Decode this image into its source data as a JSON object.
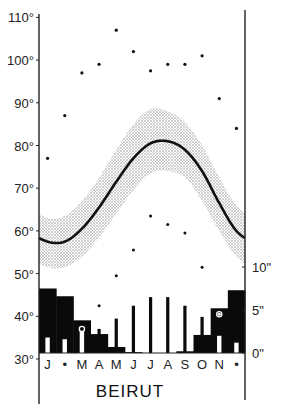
{
  "chart_data": {
    "type": "climate",
    "title": "BEIRUT",
    "months": [
      "J",
      "F",
      "M",
      "A",
      "M",
      "J",
      "J",
      "A",
      "S",
      "O",
      "N",
      "D"
    ],
    "month_label_display": [
      "J",
      "•",
      "M",
      "A",
      "M",
      "J",
      "J",
      "A",
      "S",
      "O",
      "N",
      "•"
    ],
    "temperature_axis": {
      "unit": "°F",
      "ticks": [
        30,
        40,
        50,
        60,
        70,
        80,
        90,
        100,
        110
      ],
      "tick_labels": [
        "30°",
        "40°",
        "50°",
        "60°",
        "70°",
        "80°",
        "90°",
        "100°",
        "110°"
      ],
      "range": [
        30,
        110
      ],
      "side": "left"
    },
    "precipitation_axis": {
      "unit": "inches",
      "ticks": [
        0,
        5,
        10
      ],
      "tick_labels": [
        "0\"",
        "5\"",
        "10\""
      ],
      "side": "right"
    },
    "series": [
      {
        "name": "Mean temperature",
        "type": "line",
        "values": [
          57.5,
          57.5,
          60.5,
          65.5,
          71.5,
          77,
          80.5,
          81,
          79,
          74,
          66.5,
          60
        ]
      },
      {
        "name": "Mean temperature band upper",
        "type": "area",
        "values": [
          63,
          63.5,
          67,
          72.5,
          79,
          85,
          88.5,
          88,
          85.5,
          80,
          72.5,
          66
        ]
      },
      {
        "name": "Mean temperature band lower",
        "type": "area",
        "values": [
          51.5,
          51.5,
          54,
          58.5,
          64,
          69.5,
          73.5,
          74,
          72.5,
          67,
          60,
          54
        ]
      },
      {
        "name": "Absolute maximum temperature",
        "type": "scatter",
        "values": [
          77,
          87,
          97,
          99,
          107,
          102,
          97.5,
          99,
          99,
          101,
          91,
          84
        ]
      },
      {
        "name": "Absolute minimum temperature",
        "type": "scatter",
        "values": [
          30.5,
          30.5,
          35.5,
          42.5,
          49.5,
          55.5,
          63.5,
          61.5,
          59.5,
          51.5,
          40.5,
          30
        ]
      },
      {
        "name": "Mean precipitation",
        "type": "bar",
        "unit": "inches",
        "values": [
          7.5,
          6.6,
          3.8,
          2.2,
          0.7,
          0.1,
          0,
          0,
          0.2,
          2.1,
          5.2,
          7.3
        ]
      },
      {
        "name": "Max single-day / extreme precipitation spike",
        "type": "bar",
        "unit": "inches",
        "values": [
          null,
          null,
          null,
          2.8,
          4.0,
          5.5,
          6.5,
          6.5,
          5.5,
          4.2,
          null,
          null
        ]
      },
      {
        "name": "Minimum precipitation (white bars)",
        "type": "bar",
        "unit": "inches",
        "values": [
          1.8,
          1.6,
          2.6,
          null,
          null,
          null,
          null,
          null,
          null,
          null,
          2.0,
          1.2
        ]
      }
    ],
    "circle_markers": [
      {
        "month": "M",
        "precip": 2.8
      },
      {
        "month": "N",
        "precip": 4.5
      }
    ],
    "grid": false,
    "legend": null
  },
  "labels": {
    "title": "BEIRUT"
  }
}
